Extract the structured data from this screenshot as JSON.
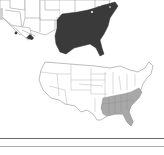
{
  "maps": [
    {
      "id": "top",
      "description": "Cropped US map with eastern/southeastern states shaded dark",
      "fill_color": "#3a3a3a",
      "outline_color": "#9a9a9a",
      "highlighted_region": "Eastern United States (Confederate & border states)"
    },
    {
      "id": "bottom",
      "description": "Full US map with southeastern states shaded gray",
      "fill_color": "#a8a8a8",
      "outline_color": "#9a9a9a",
      "highlighted_region": "Southeastern United States"
    }
  ],
  "answer_lines": [
    {
      "color": "#6a6a6a"
    },
    {
      "color": "#b0b0b0"
    }
  ],
  "colors": {
    "background": "#ffffff",
    "dark_fill": "#3a3a3a",
    "light_fill": "#a8a8a8",
    "line": "#9a9a9a"
  }
}
